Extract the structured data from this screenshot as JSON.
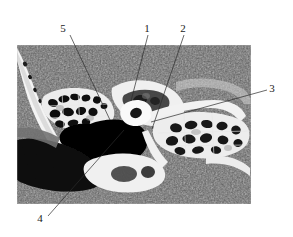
{
  "figure": {
    "name": "axial-temporal-bone-ct",
    "modality": "CT",
    "background_color": "#ffffff",
    "image_region": {
      "x": 17,
      "y": 45,
      "width": 234,
      "height": 159,
      "soft_tissue_gray": "#5a5a5a",
      "bone_white": "#f2f2f2",
      "air_black": "#080808"
    },
    "callouts": [
      {
        "id": "callout-5",
        "label": "5",
        "label_x": 63,
        "label_y": 32,
        "line_start_x": 70,
        "line_start_y": 35,
        "line_end_x": 110,
        "line_end_y": 120
      },
      {
        "id": "callout-1",
        "label": "1",
        "label_x": 147,
        "label_y": 32,
        "line_start_x": 148,
        "line_start_y": 35,
        "line_end_x": 131,
        "line_end_y": 101
      },
      {
        "id": "callout-2",
        "label": "2",
        "label_x": 183,
        "label_y": 32,
        "line_start_x": 184,
        "line_start_y": 35,
        "line_end_x": 152,
        "line_end_y": 129
      },
      {
        "id": "callout-3",
        "label": "3",
        "label_x": 270,
        "label_y": 92,
        "line_start_x": 267,
        "line_start_y": 90,
        "line_end_x": 151,
        "line_end_y": 122
      },
      {
        "id": "callout-4",
        "label": "4",
        "label_x": 38,
        "label_y": 221,
        "line_start_x": 48,
        "line_start_y": 216,
        "line_end_x": 124,
        "line_end_y": 130
      }
    ]
  }
}
